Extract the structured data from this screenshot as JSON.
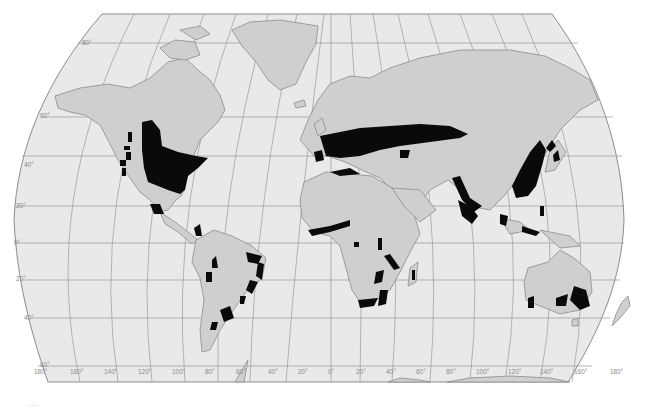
{
  "map": {
    "projection": "Robinson-like world map",
    "colors": {
      "background": "#ffffff",
      "ocean": "#e9e9e9",
      "land": "#cfcfcf",
      "border": "#8c8c8c",
      "graticule": "#9a9a9a",
      "highlight": "#0a0a0a",
      "label": "#8a8a8a"
    },
    "latitude_labels": [
      "80°",
      "60°",
      "40°",
      "20°",
      "0°",
      "20°",
      "40°",
      "60°"
    ],
    "longitude_labels": [
      "180°",
      "160°",
      "140°",
      "120°",
      "100°",
      "80°",
      "60°",
      "40°",
      "20°",
      "0°",
      "20°",
      "40°",
      "60°",
      "80°",
      "100°",
      "120°",
      "140°",
      "160°",
      "180°"
    ],
    "highlighted_regions": [
      "Eastern North America",
      "Pacific Northwest coast",
      "Western & Central Europe",
      "Caucasus",
      "Himalayan foothills / India",
      "Eastern China, Korea, Japan",
      "Southeast Asia",
      "West African coast",
      "East & Southern Africa",
      "Madagascar",
      "Eastern Brazil",
      "Southern Brazil / Uruguay",
      "Andes",
      "Southern Chile",
      "Southeast Australia",
      "Southwest Australia"
    ]
  },
  "caption": "..."
}
